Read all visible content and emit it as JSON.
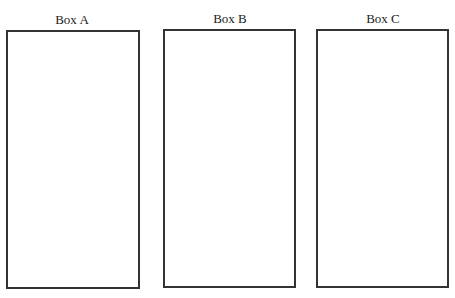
{
  "boxes": [
    {
      "label": "Box A"
    },
    {
      "label": "Box B"
    },
    {
      "label": "Box C"
    }
  ]
}
